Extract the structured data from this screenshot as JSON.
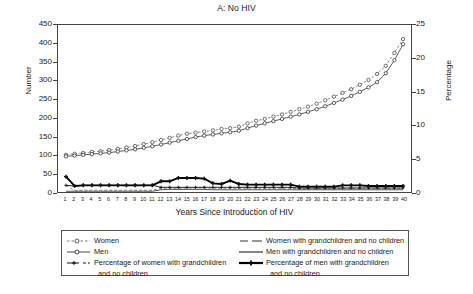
{
  "chart_data": {
    "type": "line",
    "title": "A: No HIV",
    "xlabel": "Years Since Introduction of HIV",
    "ylabel": "Number",
    "ylabel_right": "Percentage",
    "xlim": [
      1,
      40
    ],
    "ylim": [
      0,
      450
    ],
    "ylim_right": [
      0,
      25
    ],
    "yticks": [
      0,
      50,
      100,
      150,
      200,
      250,
      300,
      350,
      400,
      450
    ],
    "yticks_right": [
      0,
      5,
      10,
      15,
      20,
      25
    ],
    "grid": false,
    "legend_position": "below",
    "x": [
      1,
      2,
      3,
      4,
      5,
      6,
      7,
      8,
      9,
      10,
      11,
      12,
      13,
      14,
      15,
      16,
      17,
      18,
      19,
      20,
      21,
      22,
      23,
      24,
      25,
      26,
      27,
      28,
      29,
      30,
      31,
      32,
      33,
      34,
      35,
      36,
      37,
      38,
      39,
      40
    ],
    "series": [
      {
        "name": "Women",
        "axis": "left",
        "style": "dashed-open-circle",
        "values": [
          100,
          103,
          105,
          108,
          110,
          113,
          116,
          120,
          124,
          129,
          134,
          140,
          146,
          152,
          157,
          160,
          163,
          166,
          170,
          172,
          176,
          185,
          192,
          197,
          203,
          209,
          216,
          223,
          230,
          238,
          247,
          257,
          267,
          277,
          289,
          302,
          318,
          340,
          375,
          412
        ]
      },
      {
        "name": "Men",
        "axis": "left",
        "style": "solid-open-circle",
        "values": [
          96,
          98,
          100,
          102,
          104,
          106,
          109,
          112,
          115,
          119,
          123,
          128,
          133,
          138,
          143,
          148,
          152,
          155,
          158,
          161,
          165,
          172,
          179,
          185,
          191,
          197,
          203,
          209,
          216,
          223,
          231,
          240,
          249,
          259,
          270,
          282,
          296,
          320,
          355,
          398
        ]
      },
      {
        "name": "Women with grandchildren and no children",
        "axis": "left",
        "style": "dashed-thin",
        "values": [
          18,
          4,
          5,
          5,
          5,
          5,
          5,
          5,
          5,
          5,
          5,
          10,
          10,
          10,
          11,
          11,
          11,
          10,
          10,
          10,
          10,
          10,
          10,
          10,
          10,
          10,
          10,
          9,
          9,
          9,
          9,
          9,
          10,
          10,
          10,
          10,
          10,
          10,
          10,
          10
        ]
      },
      {
        "name": "Men with grandchildren and no children",
        "axis": "left",
        "style": "solid-thin",
        "values": [
          2,
          2,
          2,
          2,
          2,
          2,
          2,
          2,
          2,
          2,
          2,
          6,
          7,
          7,
          7,
          7,
          7,
          6,
          6,
          6,
          6,
          6,
          6,
          6,
          6,
          6,
          6,
          6,
          6,
          6,
          6,
          6,
          6,
          6,
          6,
          6,
          6,
          6,
          6,
          6
        ]
      },
      {
        "name": "Percentage of women with grandchildren and no children",
        "axis": "right",
        "style": "thin-plus",
        "values": [
          1.0,
          0.9,
          1.0,
          1.0,
          1.0,
          1.0,
          1.0,
          1.0,
          1.0,
          1.0,
          1.0,
          0.7,
          0.7,
          0.7,
          0.7,
          0.7,
          0.7,
          0.7,
          0.7,
          0.7,
          0.7,
          0.7,
          0.7,
          0.7,
          0.7,
          0.7,
          0.7,
          0.6,
          0.6,
          0.6,
          0.6,
          0.6,
          0.6,
          0.6,
          0.6,
          0.6,
          0.6,
          0.6,
          0.6,
          0.6
        ]
      },
      {
        "name": "Percentage of men with grandchildren and no children",
        "axis": "right",
        "style": "bold-plus",
        "values": [
          2.3,
          0.9,
          1.0,
          1.0,
          1.0,
          1.0,
          1.0,
          1.0,
          1.0,
          1.0,
          1.0,
          1.6,
          1.6,
          2.1,
          2.1,
          2.1,
          2.0,
          1.3,
          1.2,
          1.7,
          1.2,
          1.1,
          1.1,
          1.1,
          1.1,
          1.1,
          1.1,
          0.8,
          0.8,
          0.8,
          0.8,
          0.8,
          1.0,
          1.0,
          1.0,
          0.9,
          0.9,
          0.9,
          0.9,
          0.9
        ]
      }
    ]
  },
  "legend": {
    "items_left": [
      {
        "label": "Women",
        "key": "dashed-open-circle"
      },
      {
        "label": "Men",
        "key": "solid-open-circle"
      },
      {
        "label": "Percentage of women with grandchildren",
        "label2": "and no children",
        "key": "thin-plus"
      }
    ],
    "items_right": [
      {
        "label": "Women with grandchildren and no children",
        "key": "dashed-thin"
      },
      {
        "label": "Men with grandchildren and no children",
        "key": "solid-thin"
      },
      {
        "label": "Percentage of men with grandchildren",
        "label2": "and no children",
        "key": "bold-plus"
      }
    ]
  }
}
